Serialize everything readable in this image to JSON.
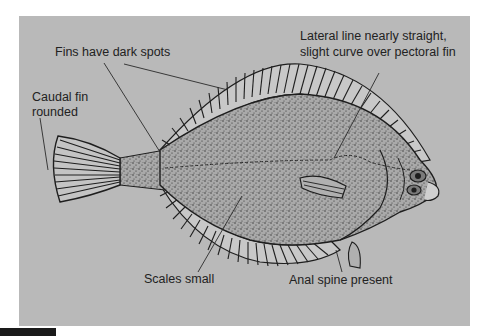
{
  "figure": {
    "background_color": "#b9b9b9",
    "ink_color": "#1e1e1e",
    "labels": [
      {
        "id": "fins",
        "text": "Fins have dark spots"
      },
      {
        "id": "caudal_line1",
        "text": "Caudal fin"
      },
      {
        "id": "caudal_line2",
        "text": "rounded"
      },
      {
        "id": "lateral_line1",
        "text": "Lateral line nearly straight,"
      },
      {
        "id": "lateral_line2",
        "text": "slight curve over pectoral fin"
      },
      {
        "id": "scales",
        "text": "Scales small"
      },
      {
        "id": "anal",
        "text": "Anal spine present"
      }
    ]
  }
}
